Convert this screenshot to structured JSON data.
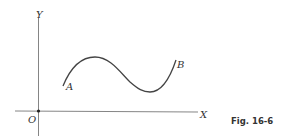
{
  "figure": {
    "caption": "Fig. 16-6",
    "axes": {
      "x_label": "X",
      "y_label": "Y",
      "origin_label": "O"
    },
    "curve": {
      "start_label": "A",
      "end_label": "B"
    },
    "colors": {
      "stroke": "#444444",
      "axis": "#555555"
    }
  }
}
